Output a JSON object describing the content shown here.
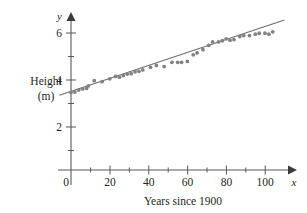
{
  "chart_data": {
    "type": "scatter",
    "title": "",
    "xlabel": "Years since 1900",
    "ylabel": "Height (m)",
    "ylabel_line1": "Height",
    "ylabel_line2": "(m)",
    "x_axis_name": "x",
    "y_axis_name": "y",
    "xlim": [
      -8,
      112
    ],
    "ylim": [
      0,
      6.8
    ],
    "x_ticks_labeled": [
      0,
      20,
      40,
      60,
      80,
      100
    ],
    "x_tick_labels": [
      "0",
      "20",
      "40",
      "60",
      "80",
      "100"
    ],
    "y_ticks_labeled": [
      2,
      4,
      6
    ],
    "y_tick_labels": [
      "2",
      "4",
      "6"
    ],
    "x_minor_ticks": [
      10,
      30,
      50,
      70,
      90,
      110
    ],
    "y_minor_ticks": [
      1,
      3,
      5
    ],
    "grid": false,
    "legend": null,
    "marker_color": "#808285",
    "line_color": "#6d6e71",
    "axis_color": "#58585a",
    "points": [
      {
        "x": 0,
        "y": 3.3
      },
      {
        "x": 2,
        "y": 3.32
      },
      {
        "x": 4,
        "y": 3.4
      },
      {
        "x": 6,
        "y": 3.45
      },
      {
        "x": 8,
        "y": 3.47
      },
      {
        "x": 9,
        "y": 3.58
      },
      {
        "x": 12,
        "y": 3.8
      },
      {
        "x": 16,
        "y": 3.76
      },
      {
        "x": 20,
        "y": 3.88
      },
      {
        "x": 23,
        "y": 3.98
      },
      {
        "x": 25,
        "y": 3.95
      },
      {
        "x": 27,
        "y": 4.02
      },
      {
        "x": 29,
        "y": 4.08
      },
      {
        "x": 31,
        "y": 4.1
      },
      {
        "x": 33,
        "y": 4.18
      },
      {
        "x": 35,
        "y": 4.2
      },
      {
        "x": 37,
        "y": 4.26
      },
      {
        "x": 41,
        "y": 4.37
      },
      {
        "x": 44,
        "y": 4.45
      },
      {
        "x": 48,
        "y": 4.4
      },
      {
        "x": 52,
        "y": 4.58
      },
      {
        "x": 55,
        "y": 4.58
      },
      {
        "x": 57,
        "y": 4.58
      },
      {
        "x": 60,
        "y": 4.62
      },
      {
        "x": 63,
        "y": 4.9
      },
      {
        "x": 65,
        "y": 4.98
      },
      {
        "x": 68,
        "y": 5.12
      },
      {
        "x": 71,
        "y": 5.3
      },
      {
        "x": 73,
        "y": 5.45
      },
      {
        "x": 76,
        "y": 5.45
      },
      {
        "x": 78,
        "y": 5.5
      },
      {
        "x": 80,
        "y": 5.58
      },
      {
        "x": 82,
        "y": 5.52
      },
      {
        "x": 84,
        "y": 5.55
      },
      {
        "x": 87,
        "y": 5.68
      },
      {
        "x": 89,
        "y": 5.72
      },
      {
        "x": 92,
        "y": 5.72
      },
      {
        "x": 95,
        "y": 5.78
      },
      {
        "x": 97,
        "y": 5.82
      },
      {
        "x": 100,
        "y": 5.82
      },
      {
        "x": 102,
        "y": 5.78
      },
      {
        "x": 104,
        "y": 5.88
      }
    ],
    "trend_line": {
      "x_start": -6,
      "y_start": 3.18,
      "x_end": 110,
      "y_end": 6.38,
      "slope": 0.0276,
      "intercept": 3.345
    }
  }
}
